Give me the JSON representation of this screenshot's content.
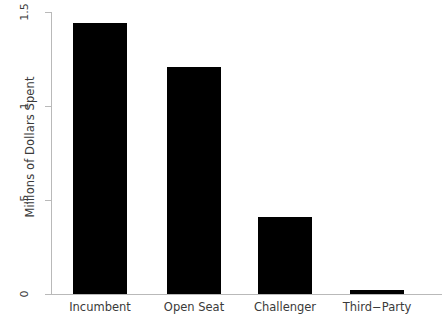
{
  "chart_data": {
    "type": "bar",
    "title": "",
    "subtitle": "",
    "xlabel": "",
    "ylabel": "Millions of Dollars Spent",
    "categories": [
      "Incumbent",
      "Open Seat",
      "Challenger",
      "Third−Party"
    ],
    "values": [
      1.44,
      1.21,
      0.41,
      0.02
    ],
    "series": [
      {
        "name": "Millions of Dollars Spent",
        "values": [
          1.44,
          1.21,
          0.41,
          0.02
        ]
      }
    ],
    "ylim": [
      0,
      1.5
    ],
    "yticks": [
      0,
      0.5,
      1,
      1.5
    ],
    "ytick_labels": [
      "0",
      ".5",
      "1",
      "1.5"
    ],
    "grid": false,
    "legend": false,
    "legend_position": "none",
    "bar_color": "#000000",
    "axis_color": "#b9b9b9",
    "text_color": "#3a3a3a",
    "background_color": "#ffffff",
    "annotations": []
  },
  "axes": {
    "y_title": "Millions of Dollars Spent",
    "y_tick_labels": [
      "1.5",
      "1",
      ".5",
      "0"
    ],
    "x_tick_labels": [
      "Incumbent",
      "Open Seat",
      "Challenger",
      "Third−Party"
    ]
  }
}
